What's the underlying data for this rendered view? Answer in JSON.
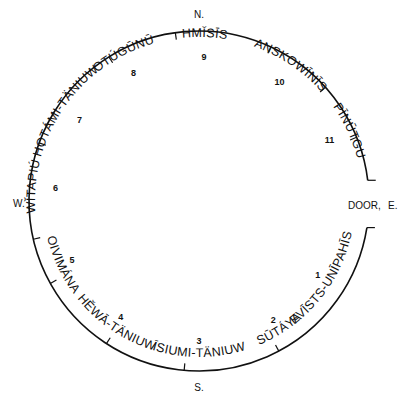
{
  "diagram": {
    "title": "",
    "directions": {
      "north": "N.",
      "south": "S.",
      "west": "W.",
      "east": "E.",
      "door": "DOOR,"
    },
    "positions": [
      {
        "number": "1",
        "name": "EVĪSTS-UNĪPAHĪS"
      },
      {
        "number": "2",
        "name": "SŪTÁYA"
      },
      {
        "number": "3",
        "name": "ĪSIUMI-TÄNIUW"
      },
      {
        "number": "4",
        "name": "HĚWĀ-TÄNIUW"
      },
      {
        "number": "5",
        "name": "OIVIMÁNA"
      },
      {
        "number": "6",
        "name": "WĬTAPIÚ"
      },
      {
        "number": "7",
        "name": "HOTÁMI-TÄNIUW"
      },
      {
        "number": "8",
        "name": "OTÚGŪNŪ"
      },
      {
        "number": "9",
        "name": "HMĬSĪS"
      },
      {
        "number": "10",
        "name": "ANSKOWĪNĪS"
      },
      {
        "number": "11",
        "name": "PĪNŪTGU"
      }
    ]
  }
}
